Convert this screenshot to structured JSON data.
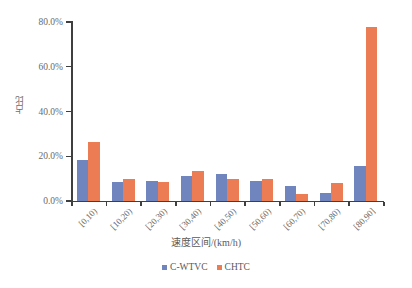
{
  "chart_data": {
    "type": "bar",
    "title": "",
    "xlabel": "速度区间/(km/h)",
    "ylabel": "占比",
    "categories": [
      "[0,10)",
      "[10,20)",
      "[20,30)",
      "[30,40)",
      "[40,50)",
      "[50,60)",
      "[60,70)",
      "[70,80)",
      "[80,90]"
    ],
    "series": [
      {
        "name": "C-WTVC",
        "color": "#7085bd",
        "values": [
          18.5,
          8.6,
          9.0,
          11.2,
          12.2,
          9.1,
          6.6,
          3.5,
          15.5
        ]
      },
      {
        "name": "CHTC",
        "color": "#ec7c53",
        "values": [
          26.5,
          9.8,
          8.3,
          13.2,
          9.8,
          9.7,
          3.0,
          8.0,
          77.8
        ]
      }
    ],
    "ylim": [
      0,
      80
    ],
    "yticks": [
      0,
      20,
      40,
      60,
      80
    ],
    "ytick_labels": [
      "0.0%",
      "20.0%",
      "40.0%",
      "60.0%",
      "80.0%"
    ],
    "grid": false,
    "legend_position": "bottom"
  }
}
